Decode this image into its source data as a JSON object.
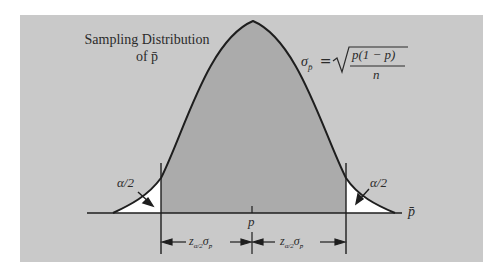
{
  "figure": {
    "title_line1": "Sampling Distribution",
    "title_line2": "of p̄",
    "formula_lhs": "σ",
    "formula_lhs_sub": "p̄",
    "formula_eq": "=",
    "formula_numerator": "p(1 − p)",
    "formula_denominator": "n",
    "tail_left_label": "α/2",
    "tail_right_label": "α/2",
    "axis_label": "p̄",
    "center_label": "p",
    "margin_left_label": "z",
    "margin_left_sub": "α/2",
    "margin_left_sigma": "σ",
    "margin_left_sigma_sub": "p̄",
    "margin_right_label": "z",
    "margin_right_sub": "α/2",
    "margin_right_sigma": "σ",
    "margin_right_sigma_sub": "p̄"
  },
  "colors": {
    "panel": "#c8c8c8",
    "curve_fill": "#a9a9a9",
    "tail_fill": "#ffffff",
    "ink": "#1e1e1e"
  }
}
